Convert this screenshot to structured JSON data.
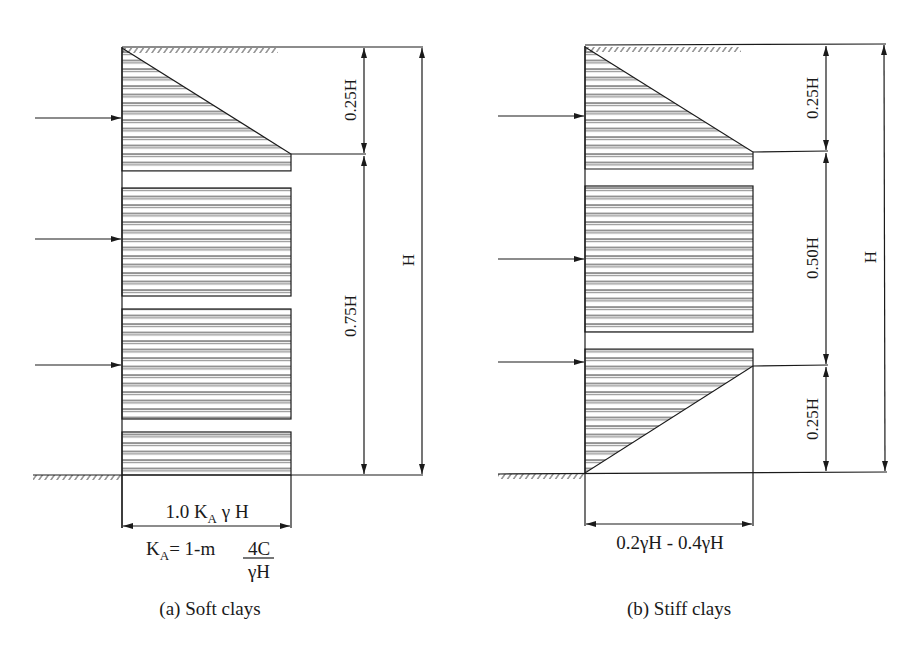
{
  "colors": {
    "ink": "#1a1a1a",
    "background": "#ffffff"
  },
  "diagrams": [
    {
      "id": "soft-clays",
      "caption": "(a) Soft clays",
      "dims": {
        "top": "0.25H",
        "middle": "0.75H",
        "total": "H"
      },
      "width_label": "1.0 K",
      "width_label_sub": "A",
      "width_label_tail": " γ H",
      "formula_lhs": "K",
      "formula_lhs_sub": "A",
      "formula_mid": "= 1-m ",
      "formula_num": "4C",
      "formula_den": "γH"
    },
    {
      "id": "stiff-clays",
      "caption": "(b) Stiff clays",
      "dims": {
        "top": "0.25H",
        "middle": "0.50H",
        "bottom": "0.25H",
        "total": "H"
      },
      "width_label": "0.2γH - 0.4γH"
    }
  ]
}
